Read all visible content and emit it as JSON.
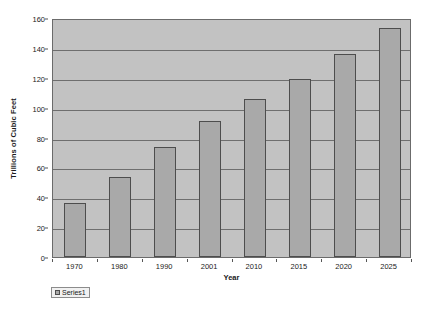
{
  "chart_data": {
    "type": "bar",
    "title": "",
    "subtitle": "",
    "xlabel": "Year",
    "ylabel": "Trillions of Cubic Feet",
    "categories": [
      "1970",
      "1980",
      "1990",
      "2001",
      "2010",
      "2015",
      "2020",
      "2025"
    ],
    "values": [
      36,
      53.5,
      73.5,
      91,
      106,
      119.5,
      136,
      153
    ],
    "series": [
      {
        "name": "Series1",
        "values": [
          36,
          53.5,
          73.5,
          91,
          106,
          119.5,
          136,
          153
        ]
      }
    ],
    "ylim": [
      0,
      160
    ],
    "ytick_labels": [
      "0",
      "20",
      "40",
      "60",
      "80",
      "100",
      "120",
      "140",
      "160"
    ],
    "ytick_values": [
      0,
      20,
      40,
      60,
      80,
      100,
      120,
      140,
      160
    ],
    "grid": true,
    "grid_axis": "y",
    "legend": {
      "position": "bottom-left",
      "entries": [
        "Series1"
      ]
    },
    "colors": {
      "bar_fill": "#a9a9a9",
      "bar_border": "#4d4d4d",
      "plot_background": "#c2c2c2",
      "page_background": "#ffffff",
      "gridline": "#6e6e6e",
      "axis": "#6b6b6b",
      "text": "#1a1a1a"
    }
  }
}
